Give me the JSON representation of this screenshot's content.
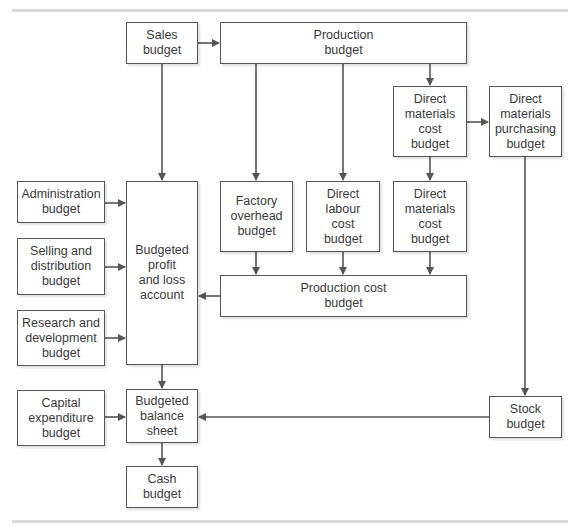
{
  "diagram": {
    "nodes": {
      "sales": "Sales\nbudget",
      "production": "Production\nbudget",
      "dm_cost_top": "Direct\nmaterials\ncost\nbudget",
      "dm_purchasing": "Direct\nmaterials\npurchasing\nbudget",
      "administration": "Administration\nbudget",
      "selling": "Selling and\ndistribution\nbudget",
      "research": "Research and\ndevelopment\nbudget",
      "profit_loss": "Budgeted\nprofit\nand loss\naccount",
      "factory_overhead": "Factory\noverhead\nbudget",
      "direct_labour": "Direct\nlabour\ncost\nbudget",
      "dm_cost_mid": "Direct\nmaterials\ncost\nbudget",
      "production_cost": "Production cost\nbudget",
      "capital": "Capital\nexpenditure\nbudget",
      "balance_sheet": "Budgeted\nbalance\nsheet",
      "stock": "Stock\nbudget",
      "cash": "Cash\nbudget"
    },
    "edges": [
      [
        "sales",
        "production"
      ],
      [
        "sales",
        "profit_loss"
      ],
      [
        "production",
        "factory_overhead"
      ],
      [
        "production",
        "direct_labour"
      ],
      [
        "production",
        "dm_cost_top"
      ],
      [
        "dm_cost_top",
        "dm_purchasing"
      ],
      [
        "dm_cost_top",
        "dm_cost_mid"
      ],
      [
        "administration",
        "profit_loss"
      ],
      [
        "selling",
        "profit_loss"
      ],
      [
        "research",
        "profit_loss"
      ],
      [
        "factory_overhead",
        "production_cost"
      ],
      [
        "direct_labour",
        "production_cost"
      ],
      [
        "dm_cost_mid",
        "production_cost"
      ],
      [
        "production_cost",
        "profit_loss"
      ],
      [
        "dm_purchasing",
        "stock"
      ],
      [
        "profit_loss",
        "balance_sheet"
      ],
      [
        "capital",
        "balance_sheet"
      ],
      [
        "stock",
        "balance_sheet"
      ],
      [
        "balance_sheet",
        "cash"
      ]
    ],
    "colors": {
      "line": "#555555",
      "rule": "#d9d9d9"
    }
  }
}
